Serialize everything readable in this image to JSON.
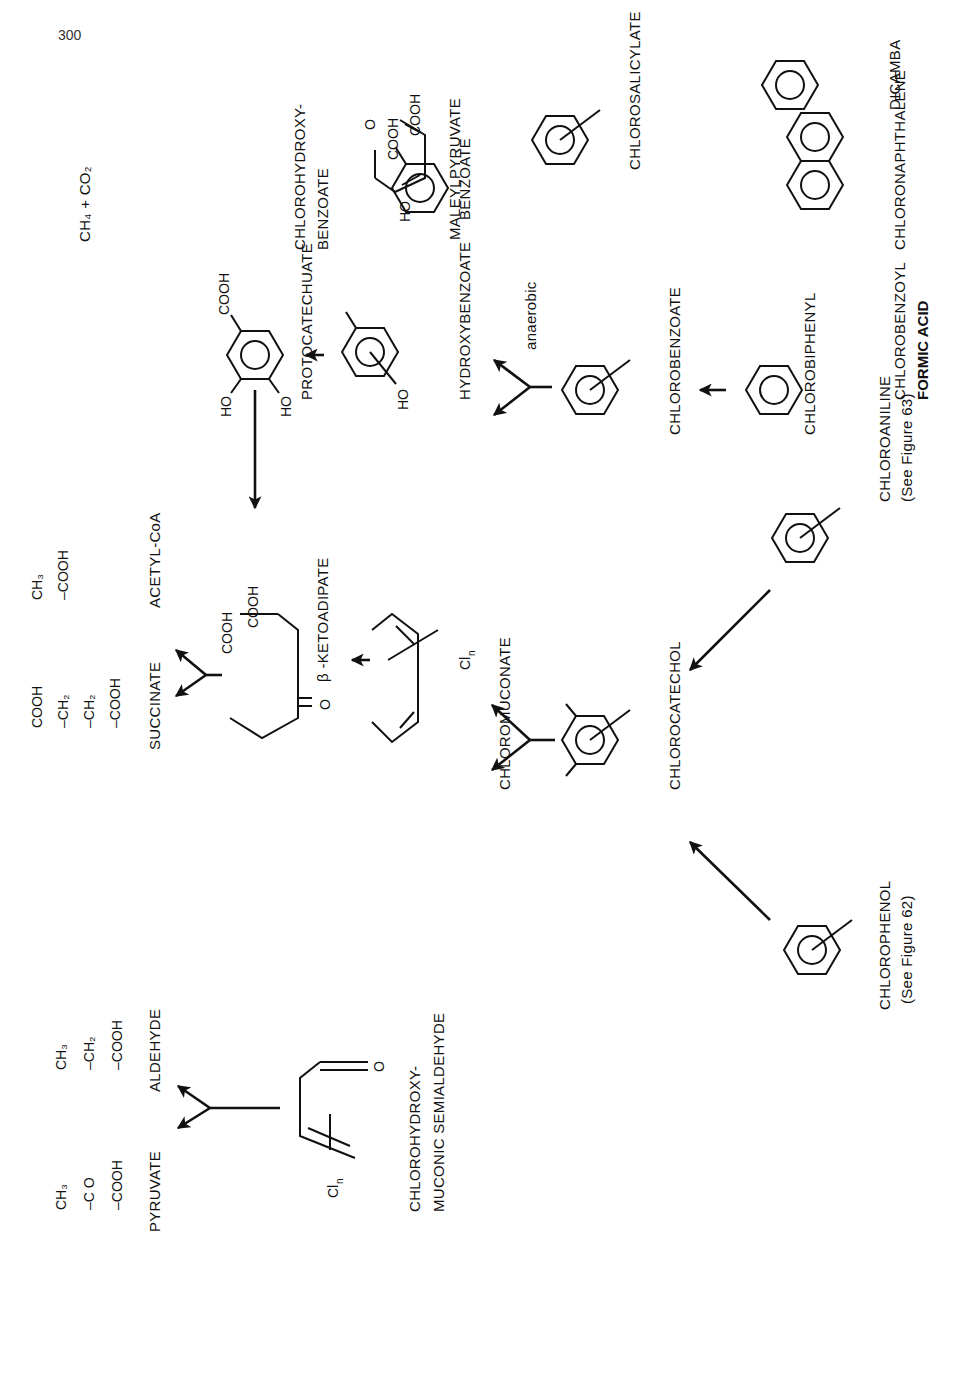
{
  "page": {
    "number": "300"
  },
  "compounds": {
    "pyruvate": {
      "label": "PYRUVATE",
      "formula": [
        "CH₃",
        "C O",
        "COOH"
      ]
    },
    "aldehyde": {
      "label": "ALDEHYDE",
      "formula": [
        "CH₃",
        "CH₂",
        "COOH"
      ]
    },
    "succinate": {
      "label": "SUCCINATE",
      "formula": [
        "COOH",
        "CH₂",
        "CH₂",
        "COOH"
      ]
    },
    "acetyl_coa": {
      "label": "ACETYL-CoA",
      "formula": [
        "CH₃",
        "COOH"
      ]
    },
    "semialdehyde": {
      "label_line1": "CHLOROHYDROXY-",
      "label_line2": "MUCONIC SEMIALDEHYDE",
      "groups": [
        "CHO",
        "COOH",
        "O",
        "Cl",
        "n"
      ]
    },
    "ketoadipate": {
      "label": "β -KETOADIPATE",
      "groups": [
        "COOH",
        "COOH",
        "O"
      ]
    },
    "muconate": {
      "label": "CHLOROMUCONATE",
      "groups": [
        "COOH",
        "COOH",
        "Cl",
        "n"
      ]
    },
    "chlorocatechol": {
      "label": "CHLOROCATECHOL",
      "groups": [
        "OH",
        "OH",
        "Cl",
        "n"
      ]
    },
    "chlorophenol": {
      "label": "CHLOROPHENOL",
      "note": "(See Figure 62)",
      "groups": [
        "OH",
        "Cl",
        "n"
      ]
    },
    "chloroaniline": {
      "label": "CHLOROANILINE",
      "note": "(See Figure 63)",
      "groups": [
        "NH₂",
        "Cl",
        "n"
      ]
    },
    "protocatechuate": {
      "label": "PROTOCATECHUATE",
      "groups": [
        "COOH",
        "HO",
        "HO"
      ]
    },
    "hydroxybenzoate": {
      "label": "HYDROXYBENZOATE",
      "groups": [
        "COOH",
        "HO"
      ]
    },
    "benzoate": {
      "label": "BENZOATE",
      "groups": [
        "COOH"
      ]
    },
    "methane_co2": {
      "label": "CH₄ + CO₂"
    },
    "chlorobenzoate": {
      "label": "CHLOROBENZOATE",
      "groups": [
        "COOH",
        "Cl",
        "n"
      ],
      "condition": "anaerobic"
    },
    "chlorobiphenyl": {
      "label": "CHLOROBIPHENYL",
      "groups": [
        "Cl",
        "n",
        "Cl",
        "n"
      ]
    },
    "chlorobenzoyl": {
      "label_line1": "CHLOROBENZOYL",
      "label_line2": "FORMIC ACID",
      "groups": [
        "O",
        "C–COOH",
        "Cl",
        "n"
      ]
    },
    "chlorohydroxybenzoate": {
      "label_line1": "CHLOROHYDROXY-",
      "label_line2": "BENZOATE",
      "groups": [
        "COOH",
        "(OH)",
        "n",
        "Cl",
        "n"
      ]
    },
    "maleylpyruvate": {
      "label": "MALEYLPYRUVATE",
      "groups": [
        "O",
        "COOH",
        "COOH",
        "HO"
      ]
    },
    "chlorosalicylate": {
      "label": "CHLOROSALICYLATE",
      "groups": [
        "COOH",
        "OH",
        "Cl",
        "n"
      ]
    },
    "chloronaphthalene": {
      "label": "CHLORONAPHTHALENE",
      "groups": [
        "Cl",
        "n",
        "Cl",
        "n"
      ]
    },
    "dicamba": {
      "label": "DICAMBA",
      "groups": [
        "COOH",
        "OCH₃",
        "Cl",
        "Cl"
      ]
    }
  }
}
